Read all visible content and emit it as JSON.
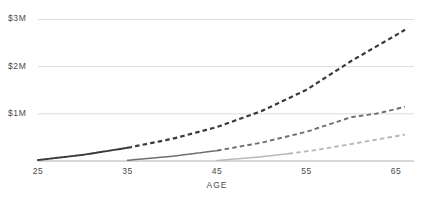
{
  "chart_data": {
    "type": "line",
    "title": "",
    "subtitle": "",
    "xlabel": "AGE",
    "ylabel": "",
    "xlim": [
      25,
      67
    ],
    "ylim": [
      0,
      3200000
    ],
    "grid": true,
    "grid_axis": "y",
    "legend": "none",
    "x_ticks": [
      25,
      35,
      45,
      55,
      65
    ],
    "x_tick_labels": [
      "25",
      "35",
      "45",
      "55",
      "65"
    ],
    "y_ticks": [
      1000000,
      2000000,
      3000000
    ],
    "y_tick_labels": [
      "$1M",
      "$2M",
      "$3M"
    ],
    "annotations": [],
    "series": [
      {
        "name": "start-age-25",
        "color": "#3a3a3a",
        "solid_until_x": 35,
        "x": [
          25,
          30,
          35,
          40,
          45,
          50,
          55,
          60,
          63,
          66
        ],
        "values": [
          20000,
          130000,
          280000,
          470000,
          720000,
          1060000,
          1510000,
          2120000,
          2450000,
          2780000
        ]
      },
      {
        "name": "start-age-35",
        "color": "#6e6e6e",
        "solid_until_x": 45,
        "x": [
          35,
          40,
          45,
          50,
          55,
          60,
          63,
          66
        ],
        "values": [
          15000,
          100000,
          220000,
          390000,
          620000,
          930000,
          1010000,
          1150000
        ]
      },
      {
        "name": "start-age-45",
        "color": "#b8b8b8",
        "solid_until_x": 53,
        "x": [
          45,
          50,
          53,
          56,
          60,
          63,
          66
        ],
        "values": [
          10000,
          90000,
          155000,
          230000,
          360000,
          460000,
          560000
        ]
      }
    ]
  },
  "colors": {
    "gridline": "#dddddd",
    "axis": "#b0b0b0",
    "tick_text": "#4a4a4a",
    "series_dark": "#3a3a3a",
    "series_mid": "#6e6e6e",
    "series_light": "#b8b8b8",
    "background": "#ffffff"
  }
}
